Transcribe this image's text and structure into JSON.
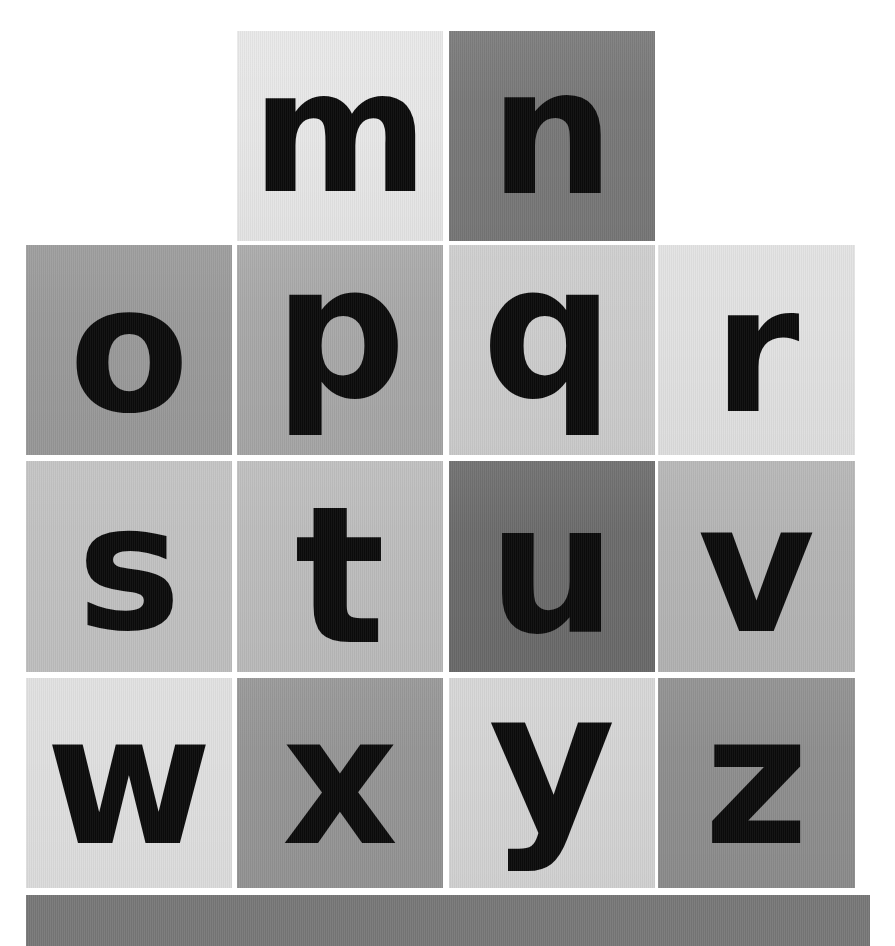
{
  "canvas": {
    "width": 895,
    "height": 946,
    "background": "#ffffff",
    "description": "Grid of photographed lowercase alphabet letter tiles, m through z"
  },
  "grid": {
    "columns": 4,
    "rows": 4,
    "column_x": [
      26,
      237,
      449,
      658
    ],
    "column_width": [
      206,
      206,
      206,
      197
    ],
    "row_y": [
      31,
      245,
      461,
      678
    ],
    "row_height": [
      210,
      210,
      211,
      210
    ],
    "gutter": 6,
    "gutter_color": "#ffffff"
  },
  "tiles": [
    {
      "letter": "m",
      "row": 0,
      "col": 1,
      "bg": "#e8e8e8",
      "x": 237,
      "y": 31,
      "w": 206,
      "h": 210,
      "font_size": 170,
      "dx": 0,
      "dy": -4
    },
    {
      "letter": "n",
      "row": 0,
      "col": 2,
      "bg": "#787878",
      "x": 449,
      "y": 31,
      "w": 206,
      "h": 210,
      "font_size": 175,
      "dx": 0,
      "dy": -4
    },
    {
      "letter": "o",
      "row": 1,
      "col": 0,
      "bg": "#9a9a9a",
      "x": 26,
      "y": 245,
      "w": 206,
      "h": 210,
      "font_size": 175,
      "dx": 0,
      "dy": 0
    },
    {
      "letter": "p",
      "row": 1,
      "col": 1,
      "bg": "#a8a8a8",
      "x": 237,
      "y": 245,
      "w": 206,
      "h": 210,
      "font_size": 185,
      "dx": 0,
      "dy": -18
    },
    {
      "letter": "q",
      "row": 1,
      "col": 2,
      "bg": "#cdcdcd",
      "x": 449,
      "y": 245,
      "w": 206,
      "h": 210,
      "font_size": 185,
      "dx": -4,
      "dy": -18
    },
    {
      "letter": "r",
      "row": 1,
      "col": 3,
      "bg": "#e2e2e2",
      "x": 658,
      "y": 245,
      "w": 197,
      "h": 210,
      "font_size": 175,
      "dx": 0,
      "dy": 0
    },
    {
      "letter": "s",
      "row": 2,
      "col": 0,
      "bg": "#c2c2c2",
      "x": 26,
      "y": 461,
      "w": 206,
      "h": 211,
      "font_size": 175,
      "dx": 0,
      "dy": 2
    },
    {
      "letter": "t",
      "row": 2,
      "col": 1,
      "bg": "#bdbdbd",
      "x": 237,
      "y": 461,
      "w": 206,
      "h": 211,
      "font_size": 190,
      "dx": 0,
      "dy": 10
    },
    {
      "letter": "u",
      "row": 2,
      "col": 2,
      "bg": "#6b6b6b",
      "x": 449,
      "y": 461,
      "w": 206,
      "h": 211,
      "font_size": 180,
      "dx": 0,
      "dy": 2
    },
    {
      "letter": "v",
      "row": 2,
      "col": 3,
      "bg": "#b5b5b5",
      "x": 658,
      "y": 461,
      "w": 197,
      "h": 211,
      "font_size": 180,
      "dx": 0,
      "dy": 2
    },
    {
      "letter": "w",
      "row": 3,
      "col": 0,
      "bg": "#e0e0e0",
      "x": 26,
      "y": 678,
      "w": 206,
      "h": 210,
      "font_size": 180,
      "dx": 0,
      "dy": -2
    },
    {
      "letter": "x",
      "row": 3,
      "col": 1,
      "bg": "#959595",
      "x": 237,
      "y": 678,
      "w": 206,
      "h": 210,
      "font_size": 180,
      "dx": 0,
      "dy": -2
    },
    {
      "letter": "y",
      "row": 3,
      "col": 2,
      "bg": "#d5d5d5",
      "x": 449,
      "y": 678,
      "w": 206,
      "h": 210,
      "font_size": 195,
      "dx": 0,
      "dy": -22
    },
    {
      "letter": "z",
      "row": 3,
      "col": 3,
      "bg": "#8e8e8e",
      "x": 658,
      "y": 678,
      "w": 197,
      "h": 210,
      "font_size": 180,
      "dx": 0,
      "dy": -2
    }
  ],
  "footer_bar": {
    "name": "bottom-strip",
    "bg": "#787878",
    "x": 26,
    "y": 895,
    "w": 844,
    "h": 51
  },
  "letters_sequence": [
    "m",
    "n",
    "o",
    "p",
    "q",
    "r",
    "s",
    "t",
    "u",
    "v",
    "w",
    "x",
    "y",
    "z"
  ],
  "glyph_color": "#0b0b0b"
}
